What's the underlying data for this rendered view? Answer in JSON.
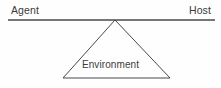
{
  "figure": {
    "background_color": "#fefefe",
    "line_color": "#4a4a4a",
    "text_color": "#3b3b3b",
    "width": 221,
    "height": 88
  },
  "labels": {
    "agent": "Agent",
    "host": "Host",
    "environment": "Environment"
  },
  "shapes": {
    "beam": {
      "name": "horizontal-beam-line",
      "x1": 8,
      "y1": 20,
      "x2": 215,
      "y2": 20,
      "stroke_width": 1.6
    },
    "triangle": {
      "name": "environment-triangle",
      "apex_x": 115,
      "apex_y": 20,
      "base_left_x": 63,
      "base_left_y": 78,
      "base_right_x": 170,
      "base_right_y": 78,
      "stroke_width": 1,
      "fill": "none"
    }
  }
}
